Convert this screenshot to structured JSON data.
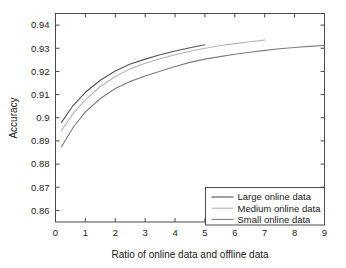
{
  "chart_data": {
    "type": "line",
    "title": "",
    "xlabel": "Ratio of online data and offline data",
    "ylabel": "Accuracy",
    "xlim": [
      0,
      9
    ],
    "ylim": [
      0.855,
      0.945
    ],
    "xticks": [
      0,
      1,
      2,
      3,
      4,
      5,
      6,
      7,
      8,
      9
    ],
    "xticklabels": [
      "0",
      "1",
      "2",
      "3",
      "4",
      "5",
      "6",
      "7",
      "8",
      "9"
    ],
    "yticks": [
      0.86,
      0.87,
      0.88,
      0.89,
      0.9,
      0.91,
      0.92,
      0.93,
      0.94
    ],
    "yticklabels": [
      "0.86",
      "0.87",
      "0.88",
      "0.89",
      "0.9",
      "0.91",
      "0.92",
      "0.93",
      "0.94"
    ],
    "grid": false,
    "legend_position": "lower right",
    "series": [
      {
        "name": "Large online data",
        "color": "#555555",
        "x": [
          0.2,
          0.6,
          1.0,
          1.5,
          2.0,
          2.5,
          3.0,
          3.5,
          4.0,
          4.5,
          5.0
        ],
        "y": [
          0.898,
          0.9055,
          0.911,
          0.9162,
          0.9202,
          0.9232,
          0.9253,
          0.9272,
          0.9288,
          0.9302,
          0.9315
        ]
      },
      {
        "name": "Medium online data",
        "color": "#b4b4b4",
        "x": [
          0.2,
          0.6,
          1.0,
          1.5,
          2.0,
          2.5,
          3.0,
          3.5,
          4.0,
          4.5,
          5.0,
          5.5,
          6.0,
          6.5,
          7.0
        ],
        "y": [
          0.8945,
          0.902,
          0.9077,
          0.9135,
          0.9178,
          0.9211,
          0.9235,
          0.9255,
          0.9272,
          0.9287,
          0.93,
          0.9311,
          0.932,
          0.9328,
          0.9335
        ]
      },
      {
        "name": "Small online data",
        "color": "#7d7d7d",
        "x": [
          0.2,
          0.6,
          1.0,
          1.5,
          2.0,
          2.5,
          3.0,
          3.5,
          4.0,
          4.5,
          5.0,
          5.5,
          6.0,
          6.5,
          7.0,
          7.5,
          8.0,
          8.5,
          9.0
        ],
        "y": [
          0.8875,
          0.896,
          0.9025,
          0.9083,
          0.9126,
          0.9157,
          0.918,
          0.9201,
          0.9221,
          0.9239,
          0.9253,
          0.9264,
          0.9274,
          0.9283,
          0.9291,
          0.9298,
          0.9303,
          0.9308,
          0.9312
        ]
      }
    ]
  },
  "legend": {
    "entries": [
      {
        "label": "Large online data"
      },
      {
        "label": "Medium online data"
      },
      {
        "label": "Small online data"
      }
    ]
  },
  "axes": {
    "x_title": "Ratio of online data and offline data",
    "y_title": "Accuracy"
  }
}
